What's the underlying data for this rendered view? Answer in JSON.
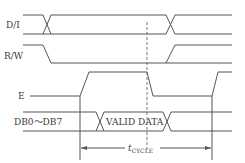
{
  "diagram": {
    "type": "timing-diagram",
    "signals": [
      {
        "name": "D/I",
        "label": "D/I",
        "kind": "bus-style"
      },
      {
        "name": "R/W",
        "label": "R/W",
        "kind": "level"
      },
      {
        "name": "E",
        "label": "E",
        "kind": "pulse"
      },
      {
        "name": "DB0~DB7",
        "label": "DB0～DB7",
        "kind": "data-bus",
        "window_label": "VALID DATA"
      }
    ],
    "annotations": {
      "cycle_label_main": "t",
      "cycle_label_sub": "CYCLE"
    },
    "colors": {
      "line": "#555555",
      "text": "#3a3a3a",
      "background": "#ffffff"
    }
  }
}
